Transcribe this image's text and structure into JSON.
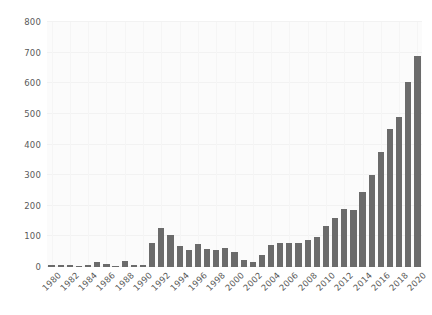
{
  "chart_data": {
    "type": "bar",
    "title": "",
    "subtitle": "",
    "xlabel": "",
    "ylabel": "",
    "grid": true,
    "legend": null,
    "bar_color": "#6b6b6b",
    "background_color": "#fbfbfb",
    "xlim": [
      "1980",
      "2020"
    ],
    "ylim": [
      0,
      800
    ],
    "y_ticks": [
      0,
      100,
      200,
      300,
      400,
      500,
      600,
      700,
      800
    ],
    "y_tick_labels": [
      "0",
      "100",
      "200",
      "300",
      "400",
      "500",
      "600",
      "700",
      "800"
    ],
    "x_tick_labels": [
      "1980",
      "1982",
      "1984",
      "1986",
      "1988",
      "1990",
      "1992",
      "1994",
      "1996",
      "1998",
      "2000",
      "2002",
      "2004",
      "2006",
      "2008",
      "2010",
      "2012",
      "2014",
      "2016",
      "2018",
      "2020"
    ],
    "categories": [
      "1980",
      "1981",
      "1982",
      "1983",
      "1984",
      "1985",
      "1986",
      "1987",
      "1988",
      "1989",
      "1990",
      "1991",
      "1992",
      "1993",
      "1994",
      "1995",
      "1996",
      "1997",
      "1998",
      "1999",
      "2000",
      "2001",
      "2002",
      "2003",
      "2004",
      "2005",
      "2006",
      "2007",
      "2008",
      "2009",
      "2010",
      "2011",
      "2012",
      "2013",
      "2014",
      "2015",
      "2016",
      "2017",
      "2018",
      "2019",
      "2020"
    ],
    "values": [
      8,
      8,
      7,
      4,
      6,
      16,
      10,
      4,
      20,
      6,
      5,
      80,
      128,
      103,
      70,
      57,
      74,
      58,
      57,
      62,
      48,
      22,
      16,
      38,
      72,
      80,
      77,
      80,
      87,
      97,
      135,
      160,
      190,
      185,
      245,
      300,
      375,
      450,
      490,
      605,
      690
    ]
  }
}
